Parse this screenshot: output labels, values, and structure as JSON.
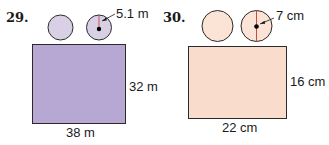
{
  "problems": [
    {
      "number": "29.",
      "radius_label": "5.1 m",
      "height_label": "32 m",
      "width_label": "38 m",
      "fill_color": "#b6a7d3",
      "circle_fill": "#d9d0e6"
    },
    {
      "number": "30.",
      "radius_label": "7 cm",
      "height_label": "16 cm",
      "width_label": "22 cm",
      "fill_color": "#f9dccb",
      "circle_fill": "#fbe3d6"
    }
  ]
}
